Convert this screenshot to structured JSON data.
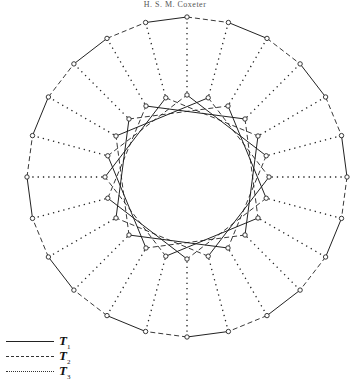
{
  "header": {
    "running_head": "H. S. M. Coxeter"
  },
  "figure": {
    "center": [
      187,
      177
    ],
    "n_vertices": 24,
    "outer_radius": 160,
    "inner_radius": 82,
    "star_step": 5,
    "vertex_marker_radius": 2.2,
    "stroke_color": "#222222"
  },
  "legend": {
    "items": [
      {
        "style": "solid",
        "label": "T",
        "subscript": "1"
      },
      {
        "style": "dashed",
        "label": "T",
        "subscript": "2"
      },
      {
        "style": "dotted",
        "label": "T",
        "subscript": "3"
      }
    ]
  }
}
